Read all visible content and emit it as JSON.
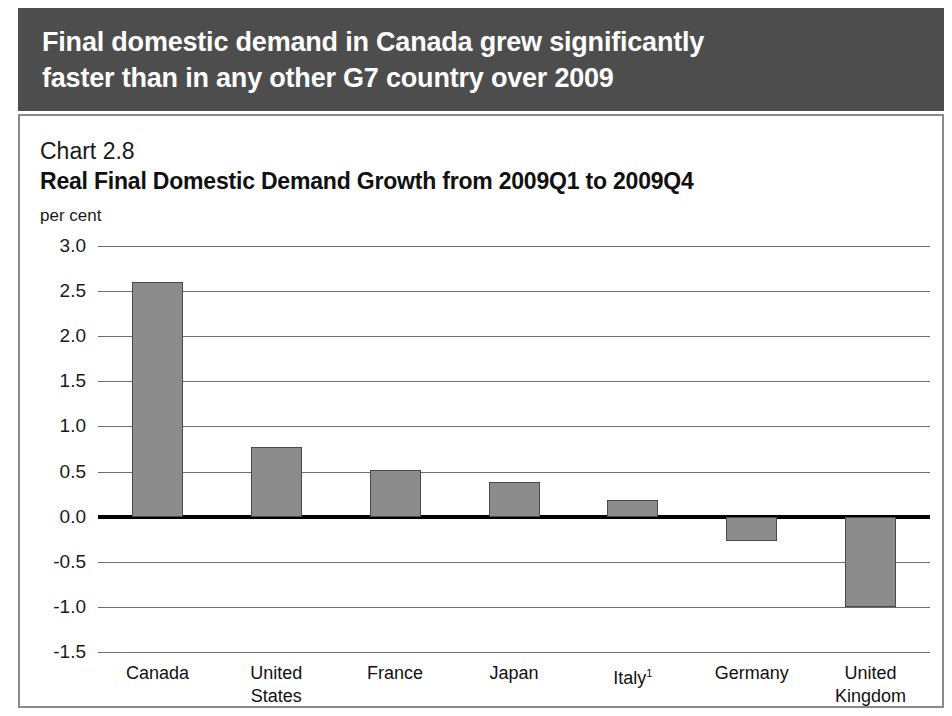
{
  "banner": {
    "title": "Final domestic demand in Canada grew significantly\nfaster than in any other G7 country over 2009"
  },
  "panel": {
    "chart_number": "Chart 2.8",
    "chart_title": "Real Final Domestic Demand Growth from 2009Q1 to 2009Q4",
    "unit_label": "per cent"
  },
  "colors": {
    "banner_background": "#4d4d4d",
    "banner_text": "#ffffff",
    "panel_border": "#8a8a8a",
    "bar_fill": "#8c8c8c",
    "bar_border": "#4a4a4a",
    "gridline": "#6e6e6e",
    "zeroline": "#000000",
    "text": "#111111"
  },
  "chart_data": {
    "type": "bar",
    "title": "Real Final Domestic Demand Growth from 2009Q1 to 2009Q4",
    "subtitle": "Chart 2.8",
    "xlabel": "",
    "ylabel": "per cent",
    "ylim": [
      -1.5,
      3.0
    ],
    "ytick_step": 0.5,
    "yticks": [
      3.0,
      2.5,
      2.0,
      1.5,
      1.0,
      0.5,
      0.0,
      -0.5,
      -1.0,
      -1.5
    ],
    "ytick_labels": [
      "3.0",
      "2.5",
      "2.0",
      "1.5",
      "1.0",
      "0.5",
      "0.0",
      "-0.5",
      "-1.0",
      "-1.5"
    ],
    "categories": [
      "Canada",
      "United\nStates",
      "France",
      "Japan",
      "Italy¹",
      "Germany",
      "United\nKingdom"
    ],
    "category_labels": [
      "Canada",
      "United States",
      "France",
      "Japan",
      "Italy1",
      "Germany",
      "United Kingdom"
    ],
    "values": [
      2.6,
      0.77,
      0.52,
      0.38,
      0.19,
      -0.27,
      -1.0
    ],
    "grid": true,
    "legend": false,
    "footnote_marker": "1"
  }
}
